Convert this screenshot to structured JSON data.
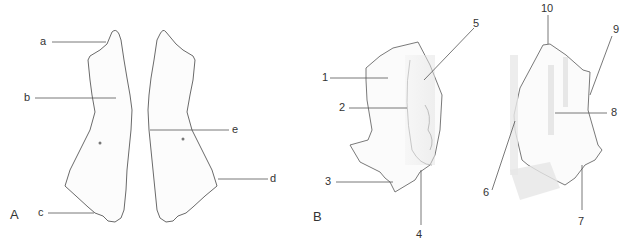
{
  "figure": {
    "panels": [
      {
        "id": "A",
        "label": "A"
      },
      {
        "id": "B",
        "label": "B"
      }
    ],
    "panel_a_labels": {
      "a": "a",
      "b": "b",
      "c": "c",
      "d": "d",
      "e": "e"
    },
    "panel_b_labels": {
      "1": "1",
      "2": "2",
      "3": "3",
      "4": "4",
      "5": "5",
      "6": "6",
      "7": "7",
      "8": "8",
      "9": "9",
      "10": "10"
    },
    "colors": {
      "outline": "#6a6a6a",
      "shade": "#e4e4e4",
      "leader": "#555555",
      "text": "#333333"
    }
  }
}
